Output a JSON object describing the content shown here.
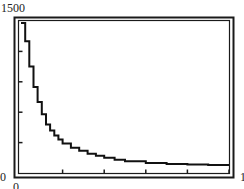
{
  "chart_data": {
    "type": "line",
    "style": "step",
    "title": "",
    "xlabel": "",
    "ylabel": "",
    "xlim": [
      0,
      1
    ],
    "ylim": [
      0,
      1500
    ],
    "grid": false,
    "legend": null,
    "y_tick_labels": [
      "0",
      "1500"
    ],
    "x_tick_labels": [
      "0",
      "1"
    ],
    "y_tick_count": 6,
    "x_tick_count": 6,
    "series": [
      {
        "name": "curve",
        "x": [
          0.0,
          0.02,
          0.04,
          0.06,
          0.08,
          0.1,
          0.12,
          0.14,
          0.16,
          0.18,
          0.2,
          0.24,
          0.28,
          0.32,
          0.36,
          0.4,
          0.45,
          0.5,
          0.6,
          0.7,
          0.8,
          0.9,
          1.0
        ],
        "y": [
          1480,
          1300,
          1050,
          850,
          700,
          580,
          480,
          420,
          370,
          330,
          290,
          250,
          220,
          190,
          170,
          150,
          130,
          115,
          100,
          90,
          85,
          80,
          80
        ]
      }
    ]
  },
  "labels": {
    "y_top": "1500",
    "y_bottom": "0",
    "x_left": "0",
    "x_right": "1"
  },
  "colors": {
    "frame": "#1a1a1a",
    "curve": "#111111",
    "background": "#ffffff"
  }
}
